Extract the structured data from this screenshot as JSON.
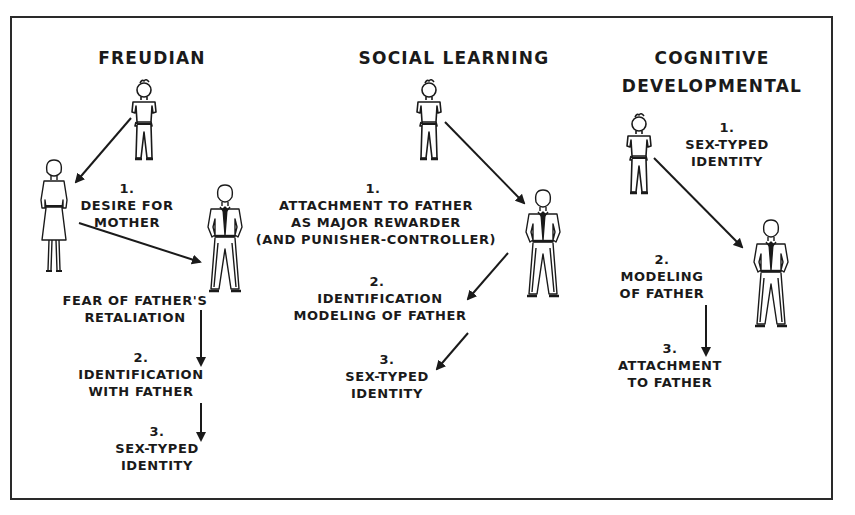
{
  "diagram": {
    "columns": [
      {
        "title": "FREUDIAN",
        "steps": [
          {
            "number": "1.",
            "text": "DESIRE FOR\nMOTHER"
          },
          {
            "number": "",
            "text": "FEAR OF FATHER'S\nRETALIATION"
          },
          {
            "number": "2.",
            "text": "IDENTIFICATION\nWITH FATHER"
          },
          {
            "number": "3.",
            "text": "SEX-TYPED\nIDENTITY"
          }
        ],
        "figures": [
          "boy",
          "mother",
          "father"
        ]
      },
      {
        "title": "SOCIAL LEARNING",
        "steps": [
          {
            "number": "1.",
            "text": "ATTACHMENT TO FATHER\nAS MAJOR REWARDER\n(AND PUNISHER-CONTROLLER)"
          },
          {
            "number": "2.",
            "text": "IDENTIFICATION\nMODELING OF FATHER"
          },
          {
            "number": "3.",
            "text": "SEX-TYPED\nIDENTITY"
          }
        ],
        "figures": [
          "boy",
          "father"
        ]
      },
      {
        "title": "COGNITIVE\nDEVELOPMENTAL",
        "steps": [
          {
            "number": "1.",
            "text": "SEX-TYPED\nIDENTITY"
          },
          {
            "number": "2.",
            "text": "MODELING\nOF FATHER"
          },
          {
            "number": "3.",
            "text": "ATTACHMENT\nTO FATHER"
          }
        ],
        "figures": [
          "boy",
          "father"
        ]
      }
    ],
    "colors": {
      "ink": "#1a1a1a",
      "border": "#2a2a2a",
      "background": "#ffffff"
    }
  }
}
